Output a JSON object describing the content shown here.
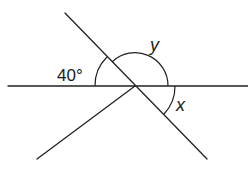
{
  "diagram": {
    "labels": {
      "given_angle": "40°",
      "unknown_y": "y",
      "unknown_x": "x"
    },
    "colors": {
      "line": "#222222",
      "background": "#ffffff"
    },
    "elements": {
      "horizontal_line": {
        "from": [
          8,
          86
        ],
        "to": [
          248,
          86
        ]
      },
      "diagonal_line": {
        "from": [
          65,
          13
        ],
        "to": [
          207,
          159
        ]
      },
      "lower_left_ray": {
        "from": [
          135,
          86
        ],
        "to": [
          37,
          159
        ]
      },
      "intersection_point": [
        135,
        86
      ]
    },
    "angles": [
      {
        "label": "40°",
        "between": [
          "horizontal-left",
          "diagonal-upper-left"
        ]
      },
      {
        "label": "y",
        "between": [
          "diagonal-upper-left",
          "horizontal-right"
        ]
      },
      {
        "label": "x",
        "between": [
          "horizontal-right",
          "diagonal-lower-right"
        ]
      }
    ]
  }
}
